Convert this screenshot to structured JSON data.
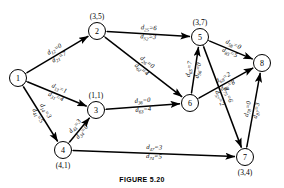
{
  "figure": {
    "caption": "FIGURE 5.20",
    "nodes": [
      {
        "id": "1",
        "label": "1",
        "pair": "",
        "x": 18,
        "y": 78
      },
      {
        "id": "2",
        "label": "2",
        "pair": "(3,5)",
        "x": 97,
        "y": 31
      },
      {
        "id": "3",
        "label": "3",
        "pair": "(1,1)",
        "x": 96,
        "y": 110
      },
      {
        "id": "4",
        "label": "4",
        "pair": "(4,1)",
        "x": 63,
        "y": 150
      },
      {
        "id": "5",
        "label": "5",
        "pair": "(3,7)",
        "x": 200,
        "y": 37
      },
      {
        "id": "6",
        "label": "6",
        "pair": "",
        "x": 190,
        "y": 103
      },
      {
        "id": "7",
        "label": "7",
        "pair": "(3,4)",
        "x": 245,
        "y": 157
      },
      {
        "id": "8",
        "label": "8",
        "pair": "",
        "x": 262,
        "y": 63
      }
    ],
    "edges": [
      {
        "id": "e12",
        "from": "1",
        "to": "2",
        "fwd": {
          "sub": "12",
          "value": "0"
        },
        "bwd": {
          "sub": "21",
          "value": "7"
        }
      },
      {
        "id": "e13",
        "from": "1",
        "to": "3",
        "fwd": {
          "sub": "13",
          "value": "1"
        },
        "bwd": {
          "sub": "31",
          "value": "4"
        }
      },
      {
        "id": "e14",
        "from": "1",
        "to": "4",
        "fwd": {
          "sub": "14",
          "value": "3"
        },
        "bwd": {
          "sub": "41",
          "value": "5"
        }
      },
      {
        "id": "e25",
        "from": "2",
        "to": "5",
        "fwd": {
          "sub": "25",
          "value": "6"
        },
        "bwd": {
          "sub": "52",
          "value": "3"
        }
      },
      {
        "id": "e26",
        "from": "2",
        "to": "6",
        "fwd": {
          "sub": "26",
          "value": "0"
        },
        "bwd": {
          "sub": "62",
          "value": "4"
        }
      },
      {
        "id": "e43",
        "from": "4",
        "to": "3",
        "fwd": {
          "sub": "43",
          "value": "3"
        },
        "bwd": {
          "sub": "34",
          "value": "0"
        }
      },
      {
        "id": "e36",
        "from": "3",
        "to": "6",
        "fwd": {
          "sub": "36",
          "value": "0"
        },
        "bwd": {
          "sub": "63",
          "value": "4"
        }
      },
      {
        "id": "e47",
        "from": "4",
        "to": "7",
        "fwd": {
          "sub": "47",
          "value": "3"
        },
        "bwd": {
          "sub": "74",
          "value": "5"
        }
      },
      {
        "id": "e65",
        "from": "6",
        "to": "5",
        "fwd": {
          "sub": "65",
          "value": "7"
        },
        "bwd": {
          "sub": "56",
          "value": "0"
        }
      },
      {
        "id": "e68",
        "from": "6",
        "to": "8",
        "fwd": {
          "sub": "68",
          "value": "2"
        },
        "bwd": {
          "sub": "86",
          "value": "8"
        }
      },
      {
        "id": "e58",
        "from": "5",
        "to": "8",
        "fwd": {
          "sub": "58",
          "value": "0"
        },
        "bwd": {
          "sub": "85",
          "value": "5"
        }
      },
      {
        "id": "e57",
        "from": "5",
        "to": "7",
        "fwd": {
          "sub": "75",
          "value": "6"
        },
        "bwd": {
          "sub": "57",
          "value": "2"
        }
      },
      {
        "id": "e78",
        "from": "7",
        "to": "8",
        "fwd": {
          "sub": "78",
          "value": "0"
        },
        "bwd": {
          "sub": "87",
          "value": "3"
        }
      }
    ],
    "colors": {
      "stroke": "#000000",
      "fill": "#ffffff"
    }
  }
}
